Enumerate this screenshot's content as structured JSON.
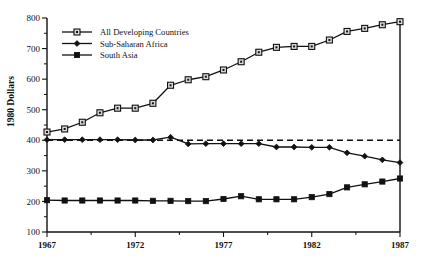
{
  "chart_data": {
    "type": "line",
    "title": "",
    "xlabel": "",
    "ylabel": "1980 Dollars",
    "xlim": [
      1967,
      1987
    ],
    "ylim": [
      100,
      800
    ],
    "grid": false,
    "legend_position": "top-left",
    "x": [
      1967,
      1968,
      1969,
      1970,
      1971,
      1972,
      1973,
      1974,
      1975,
      1976,
      1977,
      1978,
      1979,
      1980,
      1981,
      1982,
      1983,
      1984,
      1985,
      1986,
      1987
    ],
    "xtick_labels": [
      "1967",
      "1972",
      "1977",
      "1982",
      "1987"
    ],
    "xtick_values": [
      1967,
      1972,
      1977,
      1982,
      1987
    ],
    "ytick_labels": [
      "100",
      "200",
      "300",
      "400",
      "500",
      "600",
      "700",
      "800"
    ],
    "ytick_values": [
      100,
      200,
      300,
      400,
      500,
      600,
      700,
      800
    ],
    "yminor_values": [
      150,
      250,
      350,
      450,
      550,
      650,
      750
    ],
    "reference_line": {
      "value": 400,
      "style": "dashed"
    },
    "series": [
      {
        "name": "All Developing  Countries",
        "marker": "open-square",
        "values": [
          427,
          437,
          459,
          490,
          505,
          505,
          521,
          580,
          598,
          608,
          630,
          657,
          688,
          704,
          707,
          707,
          728,
          756,
          766,
          778,
          788
        ]
      },
      {
        "name": "Sub-Saharan Africa",
        "marker": "filled-diamond",
        "values": [
          402,
          402,
          402,
          402,
          402,
          401,
          401,
          410,
          388,
          389,
          389,
          389,
          389,
          378,
          378,
          377,
          377,
          359,
          348,
          336,
          327
        ]
      },
      {
        "name": "South Asia",
        "marker": "filled-square",
        "values": [
          204,
          203,
          203,
          203,
          203,
          203,
          202,
          202,
          201,
          201,
          208,
          217,
          207,
          207,
          207,
          214,
          224,
          246,
          256,
          265,
          275
        ]
      }
    ]
  },
  "legend": {
    "items": [
      {
        "label": "All Developing  Countries",
        "marker": "open-square-marker-icon"
      },
      {
        "label": "Sub-Saharan Africa",
        "marker": "filled-diamond-marker-icon"
      },
      {
        "label": "South Asia",
        "marker": "filled-square-marker-icon"
      }
    ]
  }
}
